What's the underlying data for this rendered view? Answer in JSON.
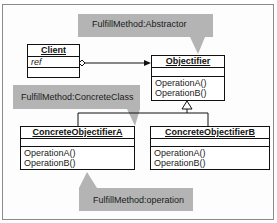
{
  "colors": {
    "callout_fill": "#b4b4b4",
    "line": "#111111",
    "frame_border": "#8a8a8a"
  },
  "callouts": [
    {
      "id": "abstractor",
      "text": "FulfillMethod:Abstractor"
    },
    {
      "id": "concrete-class",
      "text": "FulfillMethod:ConcreteClass"
    },
    {
      "id": "operation",
      "text": "FulfillMethod:operation"
    }
  ],
  "classes": {
    "client": {
      "name": "Client",
      "attributes": [
        "ref"
      ],
      "operations": []
    },
    "objectifier": {
      "name": "Objectifier",
      "attributes": [],
      "operations": [
        "OperationA()",
        "OperationB()"
      ]
    },
    "concrete_a": {
      "name": "ConcreteObjectifierA",
      "attributes": [],
      "operations": [
        "OperationA()",
        "OperationB()"
      ]
    },
    "concrete_b": {
      "name": "ConcreteObjectifierB",
      "attributes": [],
      "operations": [
        "OperationA()",
        "OperationB()"
      ]
    }
  },
  "relationships": [
    {
      "type": "aggregation",
      "from": "Client",
      "to": "Objectifier",
      "label": "ref"
    },
    {
      "type": "generalization",
      "from": "ConcreteObjectifierA",
      "to": "Objectifier"
    },
    {
      "type": "generalization",
      "from": "ConcreteObjectifierB",
      "to": "Objectifier"
    }
  ]
}
